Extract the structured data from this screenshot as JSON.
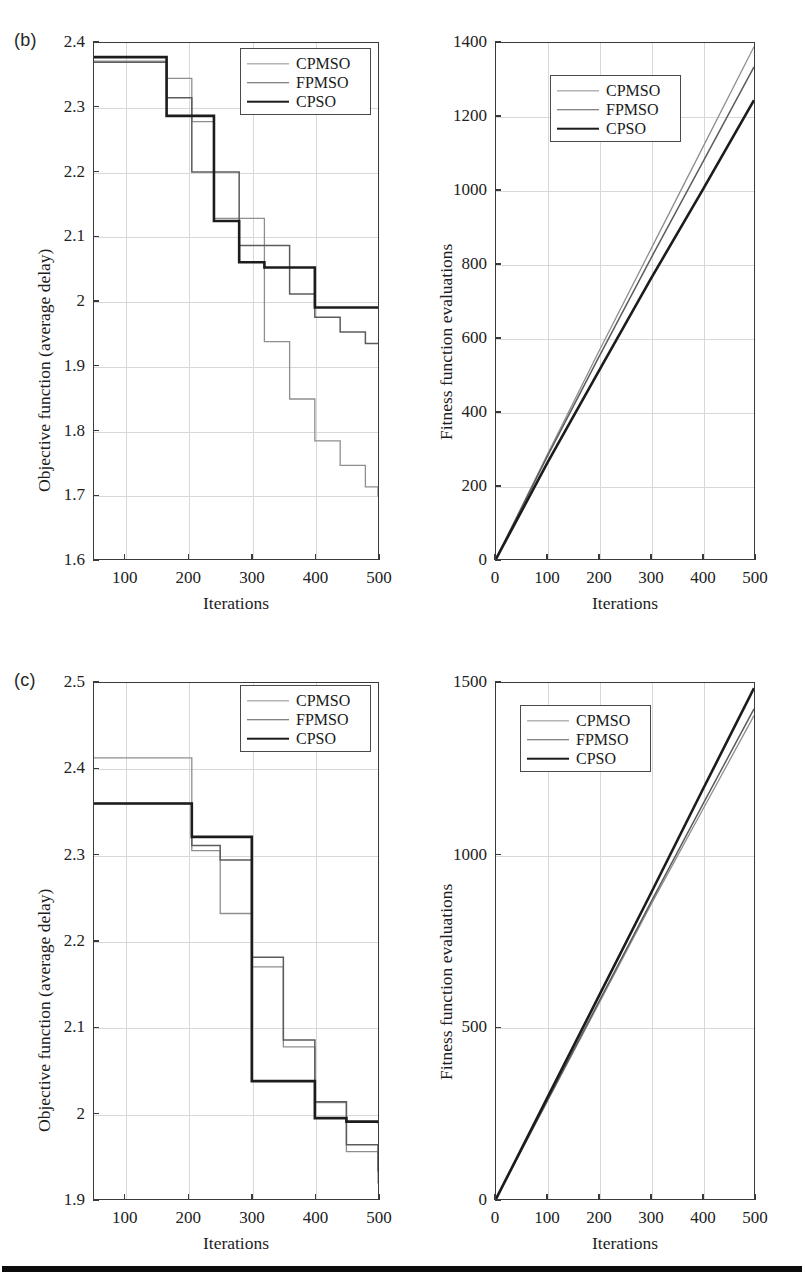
{
  "figure": {
    "background_color": "#ffffff",
    "series_styles": [
      {
        "key": "CPMSO",
        "color": "#8e8e8e",
        "width": 1.3
      },
      {
        "key": "FPMSO",
        "color": "#5c5c5c",
        "width": 1.5
      },
      {
        "key": "CPSO",
        "color": "#1c1c1c",
        "width": 2.6
      }
    ],
    "legend_entries": [
      "CPMSO",
      "FPMSO",
      "CPSO"
    ],
    "bottom_rule_color": "#0b0b0b"
  },
  "panels": {
    "b_left": {
      "tag": "(b)",
      "xlabel": "Iterations",
      "ylabel": "Objective function (average delay)",
      "xticks": [
        "100",
        "200",
        "300",
        "400",
        "500"
      ],
      "yticks": [
        "1.6",
        "1.7",
        "1.8",
        "1.9",
        "2",
        "2.1",
        "2.2",
        "2.3",
        "2.4"
      ]
    },
    "b_right": {
      "tag": "",
      "xlabel": "Iterations",
      "ylabel": "Fitness function evaluations",
      "xticks": [
        "0",
        "100",
        "200",
        "300",
        "400",
        "500"
      ],
      "yticks": [
        "0",
        "200",
        "400",
        "600",
        "800",
        "1000",
        "1200",
        "1400"
      ]
    },
    "c_left": {
      "tag": "(c)",
      "xlabel": "Iterations",
      "ylabel": "Objective function (average delay)",
      "xticks": [
        "100",
        "200",
        "300",
        "400",
        "500"
      ],
      "yticks": [
        "1.9",
        "2",
        "2.1",
        "2.2",
        "2.3",
        "2.4",
        "2.5"
      ]
    },
    "c_right": {
      "tag": "",
      "xlabel": "Iterations",
      "ylabel": "Fitness function evaluations",
      "xticks": [
        "0",
        "100",
        "200",
        "300",
        "400",
        "500"
      ],
      "yticks": [
        "0",
        "500",
        "1000",
        "1500"
      ]
    }
  },
  "chart_data": [
    {
      "id": "b_left",
      "type": "line",
      "drawstyle": "steps-post",
      "title": "(b) Objective function vs iterations",
      "xlabel": "Iterations",
      "ylabel": "Objective function (average delay)",
      "xlim": [
        50,
        500
      ],
      "ylim": [
        1.6,
        2.4
      ],
      "xticks": [
        100,
        200,
        300,
        400,
        500
      ],
      "yticks": [
        1.6,
        1.7,
        1.8,
        1.9,
        2.0,
        2.1,
        2.2,
        2.3,
        2.4
      ],
      "grid": true,
      "legend_position": "upper right",
      "series": [
        {
          "name": "CPMSO",
          "x": [
            50,
            120,
            165,
            205,
            240,
            280,
            320,
            360,
            400,
            440,
            480,
            500
          ],
          "y": [
            2.372,
            2.372,
            2.345,
            2.278,
            2.128,
            2.128,
            1.937,
            1.848,
            1.783,
            1.745,
            1.712,
            1.697
          ]
        },
        {
          "name": "FPMSO",
          "x": [
            50,
            120,
            165,
            205,
            240,
            280,
            320,
            360,
            400,
            440,
            480,
            500
          ],
          "y": [
            2.37,
            2.37,
            2.315,
            2.2,
            2.2,
            2.086,
            2.086,
            2.011,
            1.975,
            1.952,
            1.934,
            1.934
          ]
        },
        {
          "name": "CPSO",
          "x": [
            50,
            120,
            165,
            205,
            240,
            280,
            320,
            360,
            400,
            440,
            500
          ],
          "y": [
            2.378,
            2.378,
            2.287,
            2.287,
            2.124,
            2.06,
            2.052,
            2.052,
            1.99,
            1.99,
            1.99
          ]
        }
      ]
    },
    {
      "id": "b_right",
      "type": "line",
      "drawstyle": "default",
      "title": "(b) Fitness function evaluations vs iterations",
      "xlabel": "Iterations",
      "ylabel": "Fitness function evaluations",
      "xlim": [
        0,
        500
      ],
      "ylim": [
        0,
        1400
      ],
      "xticks": [
        0,
        100,
        200,
        300,
        400,
        500
      ],
      "yticks": [
        0,
        200,
        400,
        600,
        800,
        1000,
        1200,
        1400
      ],
      "grid": true,
      "legend_position": "upper left",
      "series": [
        {
          "name": "CPMSO",
          "x": [
            0,
            100,
            200,
            300,
            400,
            500
          ],
          "y": [
            0,
            285,
            565,
            840,
            1115,
            1390
          ]
        },
        {
          "name": "FPMSO",
          "x": [
            0,
            100,
            200,
            300,
            400,
            500
          ],
          "y": [
            0,
            280,
            550,
            815,
            1075,
            1335
          ]
        },
        {
          "name": "CPSO",
          "x": [
            0,
            100,
            200,
            300,
            400,
            500
          ],
          "y": [
            0,
            262,
            512,
            760,
            1000,
            1245
          ]
        }
      ]
    },
    {
      "id": "c_left",
      "type": "line",
      "drawstyle": "steps-post",
      "title": "(c) Objective function vs iterations",
      "xlabel": "Iterations",
      "ylabel": "Objective function (average delay)",
      "xlim": [
        50,
        500
      ],
      "ylim": [
        1.9,
        2.5
      ],
      "xticks": [
        100,
        200,
        300,
        400,
        500
      ],
      "yticks": [
        1.9,
        2.0,
        2.1,
        2.2,
        2.3,
        2.4,
        2.5
      ],
      "grid": true,
      "legend_position": "upper right",
      "series": [
        {
          "name": "CPMSO",
          "x": [
            50,
            150,
            205,
            250,
            300,
            350,
            400,
            450,
            500
          ],
          "y": [
            2.413,
            2.413,
            2.305,
            2.232,
            2.17,
            2.077,
            2.012,
            1.955,
            1.918
          ]
        },
        {
          "name": "FPMSO",
          "x": [
            50,
            150,
            205,
            250,
            300,
            350,
            400,
            450,
            500
          ],
          "y": [
            2.36,
            2.36,
            2.311,
            2.294,
            2.181,
            2.085,
            2.013,
            1.963,
            1.932
          ]
        },
        {
          "name": "CPSO",
          "x": [
            50,
            150,
            205,
            300,
            400,
            450,
            500
          ],
          "y": [
            2.36,
            2.36,
            2.321,
            2.037,
            1.994,
            1.99,
            1.988
          ]
        }
      ]
    },
    {
      "id": "c_right",
      "type": "line",
      "drawstyle": "default",
      "title": "(c) Fitness function evaluations vs iterations",
      "xlabel": "Iterations",
      "ylabel": "Fitness function evaluations",
      "xlim": [
        0,
        500
      ],
      "ylim": [
        0,
        1500
      ],
      "xticks": [
        0,
        100,
        200,
        300,
        400,
        500
      ],
      "yticks": [
        0,
        500,
        1000,
        1500
      ],
      "grid": true,
      "legend_position": "upper left",
      "series": [
        {
          "name": "CPMSO",
          "x": [
            0,
            100,
            200,
            300,
            400,
            500
          ],
          "y": [
            0,
            285,
            570,
            855,
            1130,
            1405
          ]
        },
        {
          "name": "FPMSO",
          "x": [
            0,
            100,
            200,
            300,
            400,
            500
          ],
          "y": [
            0,
            288,
            575,
            862,
            1145,
            1425
          ]
        },
        {
          "name": "CPSO",
          "x": [
            0,
            100,
            200,
            300,
            400,
            500
          ],
          "y": [
            0,
            296,
            592,
            888,
            1188,
            1485
          ]
        }
      ]
    }
  ]
}
